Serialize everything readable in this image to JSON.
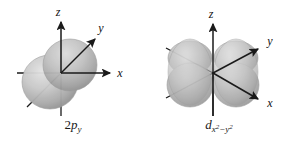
{
  "figure": {
    "background_color": "#ffffff",
    "ink_color": "#1a1a1a",
    "orbital_fill_light": "#d9d9d9",
    "orbital_fill_mid": "#b5b5b5",
    "orbital_fill_dark": "#8e8e8e",
    "panels": [
      {
        "id": "2py",
        "caption_plain": "2p_y",
        "caption_prefix": "2",
        "caption_symbol": "p",
        "caption_subscript": "y",
        "caption_subscript_sup": "",
        "shape": "two-overlapping-spheres",
        "lobe_count": 2,
        "axes": [
          {
            "name": "z",
            "label": "z",
            "direction": "up"
          },
          {
            "name": "y",
            "label": "y",
            "direction": "up-right"
          },
          {
            "name": "x",
            "label": "x",
            "direction": "right"
          }
        ]
      },
      {
        "id": "dx2-y2",
        "caption_plain": "d_x2-y2",
        "caption_prefix": "",
        "caption_symbol": "d",
        "caption_subscript": "x",
        "caption_subscript_sup": "2",
        "caption_subscript_mid": "−y",
        "caption_subscript_sup2": "2",
        "shape": "four-lobe-cloverleaf",
        "lobe_count": 4,
        "axes": [
          {
            "name": "z",
            "label": "z",
            "direction": "up"
          },
          {
            "name": "y",
            "label": "y",
            "direction": "up-right"
          },
          {
            "name": "x",
            "label": "x",
            "direction": "down-right"
          }
        ]
      }
    ]
  }
}
